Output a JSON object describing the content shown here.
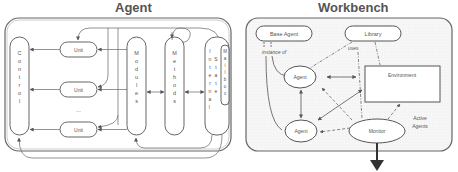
{
  "panels": {
    "agent": {
      "title": "Agent",
      "control_label": "Control",
      "units": [
        "Unit",
        "Unit",
        "Unit"
      ],
      "ellipsis": "...",
      "modules_label": "Modules",
      "methods_label": "Methods",
      "internal_state_label": "Internal State",
      "mailbox_label": "Mailbox"
    },
    "workbench": {
      "title": "Workbench",
      "base_agent_label": "Base Agent",
      "library_label": "Library",
      "instance_of_label": "instance of",
      "uses_label": "uses",
      "agent_top_label": "Agent",
      "agent_bottom_label": "Agent",
      "environment_label": "Environment",
      "monitor_label": "Monitor",
      "active_agents_label_1": "Active",
      "active_agents_label_2": "Agents"
    }
  },
  "colors": {
    "stroke": "#555555",
    "panel_bg": "#ffffff",
    "workbench_bg": "#f4f4f4",
    "text": "#555555"
  }
}
